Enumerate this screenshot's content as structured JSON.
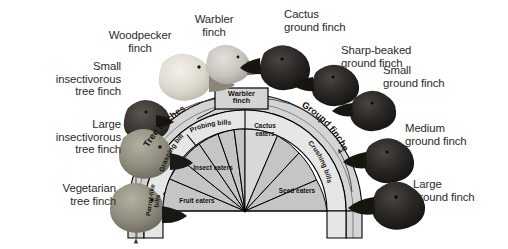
{
  "figure": {
    "title": "",
    "type": "radial-fan-diagram"
  },
  "outer_labels": [
    {
      "name": "small-insectivorous-tree-finch",
      "text": "Small\ninsectivorous\ntree finch",
      "x": 6,
      "y": 60,
      "w": 115,
      "align": "right"
    },
    {
      "name": "woodpecker-finch",
      "text": "Woodpecker\nfinch",
      "x": 88,
      "y": 29,
      "w": 104,
      "align": "center"
    },
    {
      "name": "warbler-finch",
      "text": "Warbler\nfinch",
      "x": 178,
      "y": 14,
      "w": 72,
      "align": "center"
    },
    {
      "name": "cactus-ground-finch",
      "text": "Cactus\nground finch",
      "x": 278,
      "y": 8,
      "w": 88,
      "align": "left"
    },
    {
      "name": "sharp-beaked-ground-finch",
      "text": "Sharp-beaked\nground finch",
      "x": 342,
      "y": 44,
      "w": 90,
      "align": "left"
    },
    {
      "name": "small-ground-finch",
      "text": "Small\nground finch",
      "x": 382,
      "y": 64,
      "w": 88,
      "align": "left"
    },
    {
      "name": "large-insectivorous-tree-finch",
      "text": "Large\ninsectivorous\ntree finch",
      "x": 6,
      "y": 118,
      "w": 115,
      "align": "right"
    },
    {
      "name": "medium-ground-finch",
      "text": "Medium\nground finch",
      "x": 404,
      "y": 122,
      "w": 98,
      "align": "left"
    },
    {
      "name": "vegetarian-tree-finch",
      "text": "Vegetarian\ntree finch",
      "x": 6,
      "y": 182,
      "w": 110,
      "align": "right"
    },
    {
      "name": "large-ground-finch",
      "text": "Large\nground finch",
      "x": 412,
      "y": 178,
      "w": 94,
      "align": "left"
    }
  ],
  "fan": {
    "center_x": 245,
    "center_y": 211,
    "group_labels": [
      {
        "name": "tree-finches",
        "text": "Tree finches"
      },
      {
        "name": "ground-finches",
        "text": "Ground finches"
      }
    ],
    "bill_bands": [
      {
        "name": "parrot-like-bills",
        "text": "Parrot-like\nbills"
      },
      {
        "name": "grasping-bills",
        "text": "Grasping bills"
      },
      {
        "name": "probing-bills",
        "text": "Probing bills"
      },
      {
        "name": "crushing-bills",
        "text": "Crushing bills"
      }
    ],
    "diet_wedges": [
      {
        "name": "fruit-eaters",
        "text": "Fruit eaters"
      },
      {
        "name": "insect-eaters",
        "text": "Insect eaters"
      },
      {
        "name": "cactus-eaters",
        "text": "Cactus\neaters"
      },
      {
        "name": "seed-eaters",
        "text": "Seed eaters"
      }
    ],
    "callout_box": {
      "name": "warbler-finch-box",
      "text": "Warbler\nfinch"
    }
  },
  "colors": {
    "wedge_fill": "#c9c9c9",
    "band_fill": "#e2e2e2",
    "outer_ring_fill": "#d4d4d4",
    "stroke": "#000000",
    "text": "#231f20"
  }
}
